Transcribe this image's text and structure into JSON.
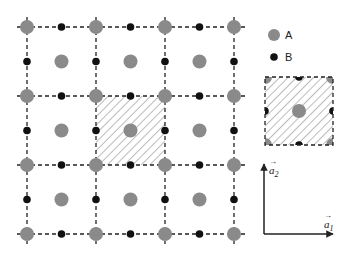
{
  "legend": {
    "items": [
      {
        "label": "A",
        "marker": "large-gray-circle",
        "color": "#8a8a8a"
      },
      {
        "label": "B",
        "marker": "small-black-dot",
        "color": "#111111"
      }
    ]
  },
  "lattice": {
    "grid_lines": [
      27,
      96,
      165,
      234
    ],
    "spacing": 69,
    "a_color": "#8a8a8a",
    "b_color": "#111111",
    "highlighted_cell": {
      "col": 1,
      "row": 1
    }
  },
  "axes": {
    "a1_label": "a",
    "a1_sub": "1",
    "a2_label": "a",
    "a2_sub": "2",
    "arrow_glyph": "→"
  }
}
